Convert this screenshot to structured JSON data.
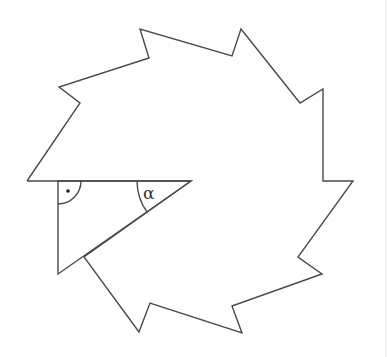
{
  "figure": {
    "type": "geometry-diagram",
    "stroke_color": "#4a4a4a",
    "background_color": "#ffffff",
    "outer_polygon_points": [
      [
        27,
        181
      ],
      [
        58,
        181
      ],
      [
        191,
        181
      ],
      [
        84,
        257
      ],
      [
        139,
        332
      ],
      [
        150,
        303
      ],
      [
        242,
        333
      ],
      [
        232,
        306
      ],
      [
        322,
        274
      ],
      [
        298,
        257
      ],
      [
        353,
        181
      ],
      [
        323,
        181
      ],
      [
        323,
        89
      ],
      [
        300,
        103
      ],
      [
        241,
        29
      ],
      [
        232,
        56
      ],
      [
        140,
        29
      ],
      [
        149,
        58
      ],
      [
        59,
        87
      ],
      [
        80,
        103
      ],
      [
        27,
        181
      ]
    ],
    "highlighted_triangle": {
      "right_angle_vertex": [
        58,
        181
      ],
      "alpha_vertex": [
        191,
        181
      ],
      "third_vertex": [
        58,
        274
      ]
    },
    "labels": {
      "alpha": "α",
      "right_angle_marker": "•"
    }
  }
}
